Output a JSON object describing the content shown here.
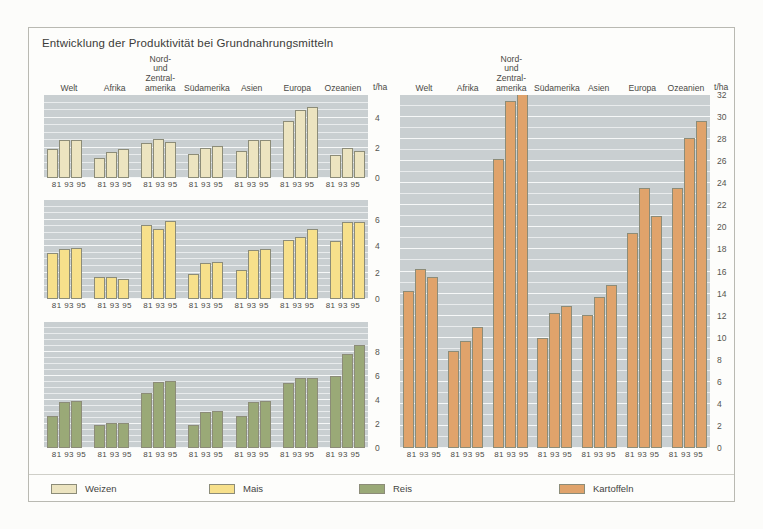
{
  "title": "Entwicklung der Produktivität bei Grundnahrungsmitteln",
  "unit_label": "t/ha",
  "regions": [
    "Welt",
    "Afrika",
    "Nord-\nund Zentral-\namerika",
    "Südamerika",
    "Asien",
    "Europa",
    "Ozeanien"
  ],
  "years": [
    "81",
    "93",
    "95"
  ],
  "xtick_label": "81 93 95",
  "colors": {
    "weizen": "#ece4c0",
    "mais": "#f7e08b",
    "reis": "#9aa977",
    "kartoffeln": "#e0a36b",
    "bar_border": "#8c8c78",
    "plot_bg": "#c9cfd1",
    "gridline": "#eef1f2",
    "page_bg": "#fdfdfb",
    "frame": "#b9b9b2",
    "text": "#3b3b39"
  },
  "legend": [
    {
      "label": "Weizen",
      "color_key": "weizen",
      "left": 22
    },
    {
      "label": "Mais",
      "color_key": "mais",
      "left": 180
    },
    {
      "label": "Reis",
      "color_key": "reis",
      "left": 330
    },
    {
      "label": "Kartoffeln",
      "color_key": "kartoffeln",
      "left": 530
    }
  ],
  "chart_data": [
    {
      "type": "bar",
      "title": "Weizen",
      "series_name": "Weizen",
      "xlabel": "",
      "ylabel": "t/ha",
      "ylim": [
        0,
        5.5
      ],
      "yticks": [
        0,
        2,
        4
      ],
      "ytick_labels": [
        "0",
        "2",
        "4"
      ],
      "minor_gridline_step": 0.5,
      "grid": true,
      "legend_position": "bottom",
      "categories": [
        "Welt",
        "Afrika",
        "Nord- und Zentralamerika",
        "Südamerika",
        "Asien",
        "Europa",
        "Ozeanien"
      ],
      "x": [
        "81",
        "93",
        "95"
      ],
      "series": [
        {
          "name": "1981",
          "values": [
            1.9,
            1.3,
            2.3,
            1.6,
            1.8,
            3.8,
            1.5
          ]
        },
        {
          "name": "1993",
          "values": [
            2.5,
            1.7,
            2.6,
            2.0,
            2.5,
            4.5,
            2.0
          ]
        },
        {
          "name": "1995",
          "values": [
            2.5,
            1.9,
            2.4,
            2.1,
            2.5,
            4.7,
            1.8
          ]
        }
      ]
    },
    {
      "type": "bar",
      "title": "Mais",
      "series_name": "Mais",
      "xlabel": "",
      "ylabel": "t/ha",
      "ylim": [
        0,
        7.5
      ],
      "yticks": [
        0,
        2,
        4,
        6
      ],
      "ytick_labels": [
        "0",
        "2",
        "4",
        "6"
      ],
      "minor_gridline_step": 0.5,
      "grid": true,
      "legend_position": "bottom",
      "categories": [
        "Welt",
        "Afrika",
        "Nord- und Zentralamerika",
        "Südamerika",
        "Asien",
        "Europa",
        "Ozeanien"
      ],
      "x": [
        "81",
        "93",
        "95"
      ],
      "series": [
        {
          "name": "1981",
          "values": [
            3.5,
            1.7,
            5.6,
            1.9,
            2.2,
            4.5,
            4.4
          ]
        },
        {
          "name": "1993",
          "values": [
            3.8,
            1.7,
            5.3,
            2.7,
            3.7,
            4.7,
            5.8
          ]
        },
        {
          "name": "1995",
          "values": [
            3.9,
            1.5,
            5.9,
            2.8,
            3.8,
            5.3,
            5.8
          ]
        }
      ]
    },
    {
      "type": "bar",
      "title": "Reis",
      "series_name": "Reis",
      "xlabel": "",
      "ylabel": "t/ha",
      "ylim": [
        0,
        10.5
      ],
      "yticks": [
        0,
        2,
        4,
        6,
        8
      ],
      "ytick_labels": [
        "0",
        "2",
        "4",
        "6",
        "8"
      ],
      "minor_gridline_step": 0.5,
      "grid": true,
      "legend_position": "bottom",
      "categories": [
        "Welt",
        "Afrika",
        "Nord- und Zentralamerika",
        "Südamerika",
        "Asien",
        "Europa",
        "Ozeanien"
      ],
      "x": [
        "81",
        "93",
        "95"
      ],
      "series": [
        {
          "name": "1981",
          "values": [
            2.7,
            1.9,
            4.6,
            1.9,
            2.7,
            5.4,
            6.0
          ]
        },
        {
          "name": "1993",
          "values": [
            3.8,
            2.1,
            5.5,
            3.0,
            3.8,
            5.8,
            7.8
          ]
        },
        {
          "name": "1995",
          "values": [
            3.9,
            2.1,
            5.6,
            3.1,
            3.9,
            5.8,
            8.6
          ]
        }
      ]
    },
    {
      "type": "bar",
      "title": "Kartoffeln",
      "series_name": "Kartoffeln",
      "xlabel": "",
      "ylabel": "t/ha",
      "ylim": [
        0,
        32
      ],
      "yticks": [
        0,
        2,
        4,
        6,
        8,
        10,
        12,
        14,
        16,
        18,
        20,
        22,
        24,
        26,
        28,
        30,
        32
      ],
      "ytick_labels": [
        "0",
        "2",
        "4",
        "6",
        "8",
        "10",
        "12",
        "14",
        "16",
        "18",
        "20",
        "22",
        "24",
        "26",
        "28",
        "30",
        "32"
      ],
      "minor_gridline_step": 1,
      "grid": true,
      "legend_position": "bottom",
      "categories": [
        "Welt",
        "Afrika",
        "Nord- und Zentralamerika",
        "Südamerika",
        "Asien",
        "Europa",
        "Ozeanien"
      ],
      "x": [
        "81",
        "93",
        "95"
      ],
      "series": [
        {
          "name": "1981",
          "values": [
            14.2,
            8.8,
            26.2,
            10.0,
            12.1,
            19.5,
            23.6
          ]
        },
        {
          "name": "1993",
          "values": [
            16.2,
            9.7,
            31.5,
            12.2,
            13.7,
            23.6,
            28.1
          ]
        },
        {
          "name": "1995",
          "values": [
            15.5,
            11.0,
            32.2,
            12.9,
            14.8,
            21.0,
            29.6
          ]
        }
      ]
    }
  ]
}
